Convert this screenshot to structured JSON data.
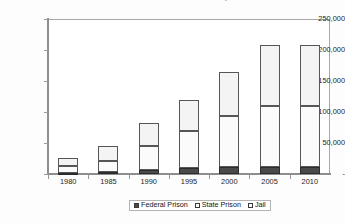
{
  "chart_data": {
    "type": "bar",
    "subtype": "stacked-column",
    "title": "NUMBER OF INCARCERATED WOMEN, 1980-2010",
    "xlabel": "",
    "ylabel": "",
    "categories": [
      "1980",
      "1985",
      "1990",
      "1995",
      "2000",
      "2005",
      "2010"
    ],
    "series": [
      {
        "name": "Federal Prison",
        "color": "#4a4a4a",
        "values": [
          2000,
          3000,
          7000,
          9000,
          11000,
          12000,
          12000
        ]
      },
      {
        "name": "State Prison",
        "color": "#fbfbfb",
        "values": [
          11000,
          18000,
          38000,
          61000,
          82000,
          98000,
          98000
        ]
      },
      {
        "name": "Jail",
        "color": "#f4f4f4",
        "values": [
          13000,
          24000,
          38000,
          50000,
          72000,
          98000,
          98000
        ]
      }
    ],
    "totals": [
      26000,
      45000,
      83000,
      120000,
      165000,
      208000,
      208000
    ],
    "ylim": [
      0,
      250000
    ],
    "yticks": [
      0,
      50000,
      100000,
      150000,
      200000,
      250000
    ],
    "ytick_labels": [
      "-",
      "50,000",
      "100,000",
      "150,000",
      "200,000",
      "250,000"
    ],
    "grid": false,
    "legend_position": "bottom"
  },
  "legend": {
    "items": [
      {
        "label": "Federal Prison",
        "swatch": "federal-swatch"
      },
      {
        "label": "State Prison",
        "swatch": "state-swatch"
      },
      {
        "label": "Jail",
        "swatch": "jail-swatch"
      }
    ]
  }
}
